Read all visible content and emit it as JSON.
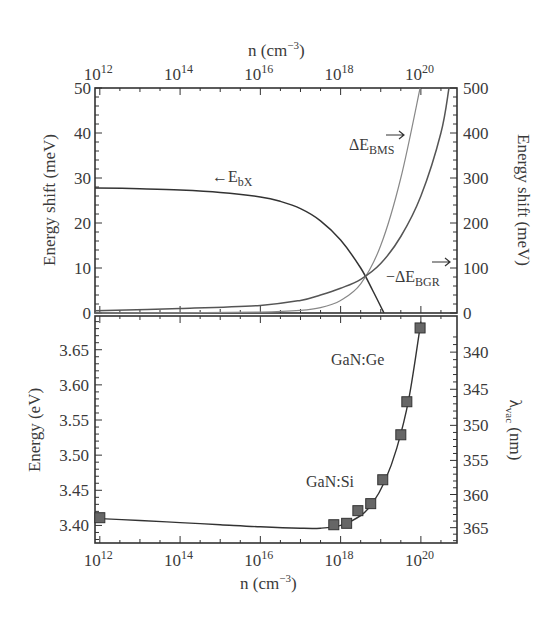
{
  "chart_data": [
    {
      "type": "line",
      "panel": "top",
      "title": "",
      "xlabel": "n (cm⁻³)",
      "x_scale": "log",
      "x_ticks": [
        "10^12",
        "10^14",
        "10^16",
        "10^18",
        "10^20"
      ],
      "xlim_log10": [
        11.88,
        20.9
      ],
      "ylabel": "Energy shift (meV)",
      "ylim": [
        0,
        50
      ],
      "y_ticks": [
        0,
        10,
        20,
        30,
        40,
        50
      ],
      "ylabel_right": "Energy shift (meV)",
      "ylim_right": [
        0,
        500
      ],
      "y_ticks_right": [
        0,
        100,
        200,
        300,
        400,
        500
      ],
      "series": [
        {
          "name": "E_bX",
          "axis": "left",
          "annotation": "←E_bX",
          "log10_n": [
            11.88,
            13,
            14,
            15,
            16,
            16.5,
            17,
            17.5,
            18,
            18.5,
            18.8,
            19.08
          ],
          "values": [
            27.8,
            27.6,
            27.3,
            26.8,
            25.8,
            24.8,
            23.2,
            20.5,
            16.2,
            10.0,
            5.0,
            0
          ]
        },
        {
          "name": "ΔE_BMS",
          "axis": "right",
          "annotation": "ΔE_BMS →",
          "log10_n": [
            11.88,
            14,
            16,
            17,
            17.5,
            18,
            18.5,
            19,
            19.5,
            19.98
          ],
          "values": [
            0,
            0.5,
            2,
            6,
            12,
            28,
            65,
            150,
            300,
            500
          ]
        },
        {
          "name": "-ΔE_BGR",
          "axis": "right",
          "annotation": "−ΔE_BGR →",
          "log10_n": [
            11.88,
            14,
            16,
            17,
            17.5,
            18,
            18.5,
            19,
            19.5,
            20,
            20.5,
            20.7
          ],
          "values": [
            5,
            10,
            17,
            28,
            40,
            55,
            75,
            110,
            170,
            260,
            400,
            500
          ]
        }
      ]
    },
    {
      "type": "scatter",
      "panel": "bottom",
      "title": "",
      "xlabel": "n (cm⁻³)",
      "x_scale": "log",
      "x_ticks": [
        "10^12",
        "10^14",
        "10^16",
        "10^18",
        "10^20"
      ],
      "xlim_log10": [
        11.88,
        20.9
      ],
      "ylabel": "Energy (eV)",
      "ylim": [
        3.375,
        3.698
      ],
      "y_ticks": [
        3.4,
        3.45,
        3.5,
        3.55,
        3.6,
        3.65
      ],
      "ylabel_right": "λ_vac (nm)",
      "y_ticks_right": [
        340,
        345,
        350,
        355,
        360,
        365
      ],
      "annotations": [
        "GaN:Ge",
        "GaN:Si"
      ],
      "series": [
        {
          "name": "measured",
          "marker": "square",
          "log10_n": [
            12.0,
            17.83,
            18.15,
            18.43,
            18.75,
            19.05,
            19.5,
            19.65,
            19.98
          ],
          "values": [
            3.411,
            3.401,
            3.403,
            3.421,
            3.431,
            3.465,
            3.529,
            3.576,
            3.681
          ]
        },
        {
          "name": "fit",
          "marker": "none",
          "log10_n": [
            11.88,
            13,
            14,
            15,
            16,
            17,
            17.5,
            18,
            18.5,
            18.8,
            19.1,
            19.4,
            19.7,
            20.0
          ],
          "values": [
            3.41,
            3.407,
            3.404,
            3.401,
            3.398,
            3.396,
            3.396,
            3.4,
            3.414,
            3.432,
            3.463,
            3.51,
            3.58,
            3.69
          ]
        }
      ]
    }
  ],
  "labels": {
    "top_xlabel": "n (cm",
    "xlabel_sup": "−3",
    "xlabel_close": ")",
    "top_ylabel": "Energy shift (meV)",
    "top_ylabel_right": "Energy shift (meV)",
    "bottom_ylabel": "Energy (eV)",
    "bottom_ylabel_right_lambda": "λ",
    "bottom_ylabel_right_sub": "vac",
    "bottom_ylabel_right_rest": " (nm)",
    "bottom_xlabel": "n (cm",
    "ebx_arrow": "←E",
    "ebx_sub": "bX",
    "bms_main": "ΔE",
    "bms_sub": "BMS",
    "bgr_main": "−ΔE",
    "bgr_sub": "BGR",
    "gan_ge": "GaN:Ge",
    "gan_si": "GaN:Si",
    "x_tick_base": "10",
    "x_tick_exps": [
      "12",
      "14",
      "16",
      "18",
      "20"
    ],
    "top_left_ticks": [
      "0",
      "10",
      "20",
      "30",
      "40",
      "50"
    ],
    "top_right_ticks": [
      "0",
      "100",
      "200",
      "300",
      "400",
      "500"
    ],
    "bot_left_ticks": [
      "3.40",
      "3.45",
      "3.50",
      "3.55",
      "3.60",
      "3.65"
    ],
    "bot_right_ticks": [
      "365",
      "360",
      "355",
      "350",
      "345",
      "340"
    ]
  }
}
